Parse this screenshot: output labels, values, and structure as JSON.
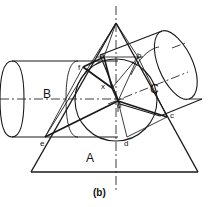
{
  "figure": {
    "caption": "(b)",
    "stroke_color": "#1a1a1a",
    "background_color": "#ffffff",
    "width": 209,
    "height": 207,
    "region_labels": [
      {
        "text": "A",
        "x": 86,
        "y": 152
      },
      {
        "text": "B",
        "x": 43,
        "y": 88
      },
      {
        "text": "C",
        "x": 150,
        "y": 83
      }
    ],
    "point_labels": [
      {
        "text": "a",
        "x": 100,
        "y": 52
      },
      {
        "text": "b",
        "x": 137,
        "y": 52
      },
      {
        "text": "c",
        "x": 170,
        "y": 112
      },
      {
        "text": "d",
        "x": 124,
        "y": 140
      },
      {
        "text": "e",
        "x": 40,
        "y": 140
      },
      {
        "text": "f",
        "x": 78,
        "y": 64
      },
      {
        "text": "o",
        "x": 117,
        "y": 102
      },
      {
        "text": "x",
        "x": 101,
        "y": 83
      }
    ]
  }
}
